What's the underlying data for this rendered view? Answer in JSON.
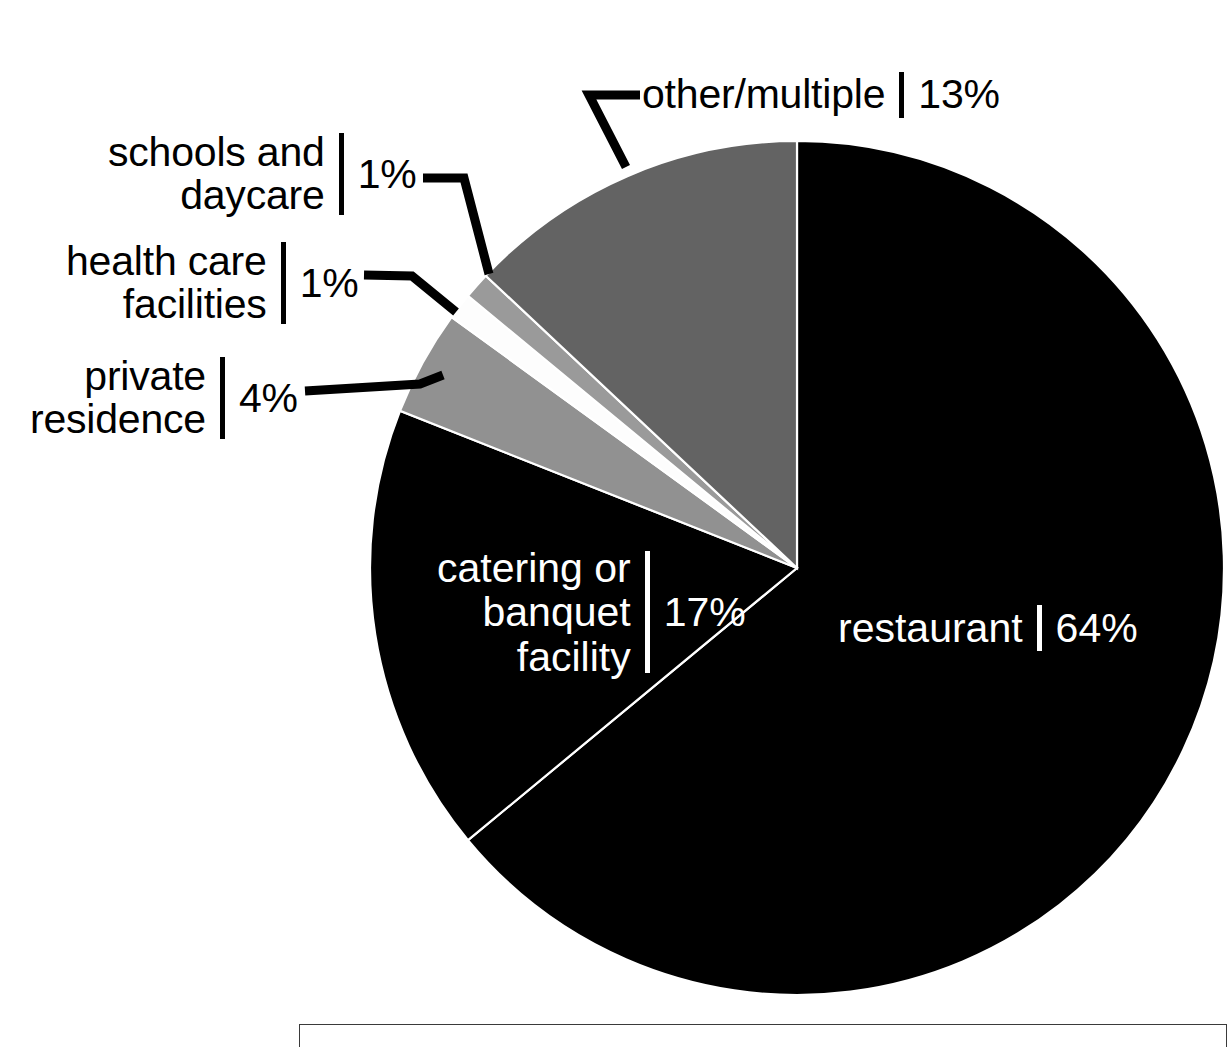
{
  "chart_data": {
    "type": "pie",
    "title": "",
    "subtitle": "",
    "xlabel": "",
    "ylabel": "",
    "legend_position": "callout-labels",
    "grid": false,
    "unit": "%",
    "start_angle_deg": 0,
    "direction": "clockwise",
    "categories": [
      "restaurant",
      "catering or banquet facility",
      "private residence",
      "health care facilities",
      "schools and daycare",
      "other/multiple"
    ],
    "values": [
      64,
      17,
      4,
      1,
      1,
      13
    ],
    "slices": [
      {
        "label": "restaurant",
        "value": 64,
        "value_text": "64%",
        "color": "#000000",
        "label_placement": "inside",
        "label_color": "#ffffff"
      },
      {
        "label": "catering or banquet facility",
        "value": 17,
        "value_text": "17%",
        "color": "#000000",
        "label_placement": "inside",
        "label_color": "#ffffff"
      },
      {
        "label": "private residence",
        "value": 4,
        "value_text": "4%",
        "color": "#919191",
        "label_placement": "callout-left",
        "label_color": "#000000"
      },
      {
        "label": "health care facilities",
        "value": 1,
        "value_text": "1%",
        "color": "#fdfdfd",
        "label_placement": "callout-left",
        "label_color": "#000000"
      },
      {
        "label": "schools and daycare",
        "value": 1,
        "value_text": "1%",
        "color": "#9a9a9a",
        "label_placement": "callout-left",
        "label_color": "#000000"
      },
      {
        "label": "other/multiple",
        "value": 13,
        "value_text": "13%",
        "color": "#636363",
        "label_placement": "callout-top",
        "label_color": "#000000"
      }
    ]
  },
  "labels": {
    "other": {
      "name": "other/multiple",
      "value": "13%"
    },
    "schools": {
      "name_line1": "schools and",
      "name_line2": "daycare",
      "value": "1%"
    },
    "health": {
      "name_line1": "health care",
      "name_line2": "facilities",
      "value": "1%"
    },
    "private": {
      "name_line1": "private",
      "name_line2": "residence",
      "value": "4%"
    },
    "catering": {
      "name_line1": "catering or",
      "name_line2": "banquet",
      "name_line3": "facility",
      "value": "17%"
    },
    "restaurant": {
      "name": "restaurant",
      "value": "64%"
    }
  },
  "colors": {
    "background": "#ffffff",
    "slice_black": "#000000",
    "slice_dark_gray": "#636363",
    "slice_light_gray": "#9a9a9a",
    "slice_mid_gray": "#919191",
    "slice_white": "#fdfdfd",
    "text_dark": "#000000",
    "text_light": "#ffffff",
    "leader_line": "#000000",
    "box_border": "#3a3a3a"
  }
}
